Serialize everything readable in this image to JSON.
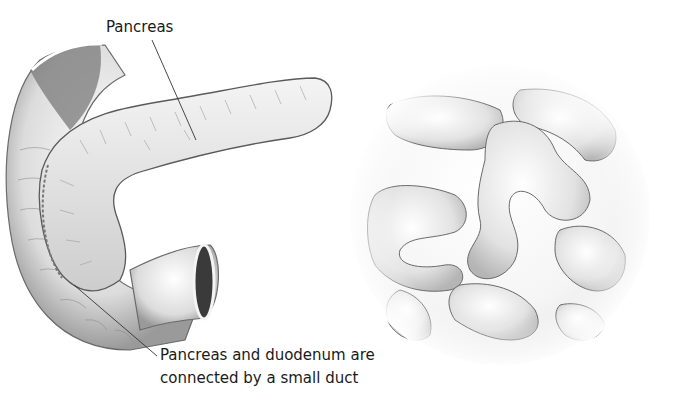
{
  "figure": {
    "panels": [
      {
        "id": "left",
        "subject": "pancreas-with-duodenum"
      },
      {
        "id": "right",
        "subject": "small-intestine-coils"
      }
    ],
    "colors": {
      "background": "#ffffff",
      "tissue_light": "#f2f2f2",
      "tissue_mid": "#cfcfcf",
      "tissue_dark": "#6e6e6e",
      "outline": "#555555",
      "leader_line": "#333333"
    }
  },
  "labels": {
    "pancreas": "Pancreas",
    "duct_line1": "Pancreas and duodenum are",
    "duct_line2": "connected by a small duct"
  }
}
